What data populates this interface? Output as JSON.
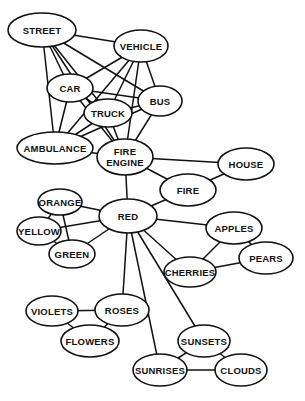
{
  "nodes": [
    {
      "id": "street",
      "label": [
        "STREET"
      ],
      "cx": 42,
      "cy": 30,
      "rx": 34,
      "ry": 17
    },
    {
      "id": "vehicle",
      "label": [
        "VEHICLE"
      ],
      "cx": 141,
      "cy": 46,
      "rx": 27,
      "ry": 16
    },
    {
      "id": "car",
      "label": [
        "CAR"
      ],
      "cx": 70,
      "cy": 88,
      "rx": 23,
      "ry": 14
    },
    {
      "id": "bus",
      "label": [
        "BUS"
      ],
      "cx": 160,
      "cy": 101,
      "rx": 22,
      "ry": 15
    },
    {
      "id": "truck",
      "label": [
        "TRUCK"
      ],
      "cx": 108,
      "cy": 113,
      "rx": 24,
      "ry": 14
    },
    {
      "id": "ambulance",
      "label": [
        "AMBULANCE"
      ],
      "cx": 55,
      "cy": 148,
      "rx": 38,
      "ry": 16
    },
    {
      "id": "fire-engine",
      "label": [
        "FIRE",
        "ENGINE"
      ],
      "cx": 125,
      "cy": 157,
      "rx": 28,
      "ry": 18
    },
    {
      "id": "house",
      "label": [
        "HOUSE"
      ],
      "cx": 246,
      "cy": 164,
      "rx": 28,
      "ry": 16
    },
    {
      "id": "fire",
      "label": [
        "FIRE"
      ],
      "cx": 188,
      "cy": 190,
      "rx": 28,
      "ry": 16
    },
    {
      "id": "orange",
      "label": [
        "ORANGE"
      ],
      "cx": 60,
      "cy": 202,
      "rx": 22,
      "ry": 13
    },
    {
      "id": "red",
      "label": [
        "RED"
      ],
      "cx": 128,
      "cy": 216,
      "rx": 29,
      "ry": 17
    },
    {
      "id": "yellow",
      "label": [
        "YELLOW"
      ],
      "cx": 39,
      "cy": 231,
      "rx": 22,
      "ry": 14
    },
    {
      "id": "apples",
      "label": [
        "APPLES"
      ],
      "cx": 234,
      "cy": 228,
      "rx": 28,
      "ry": 16
    },
    {
      "id": "green",
      "label": [
        "GREEN"
      ],
      "cx": 72,
      "cy": 254,
      "rx": 23,
      "ry": 14
    },
    {
      "id": "pears",
      "label": [
        "PEARS"
      ],
      "cx": 266,
      "cy": 258,
      "rx": 27,
      "ry": 16
    },
    {
      "id": "cherries",
      "label": [
        "CHERRIES"
      ],
      "cx": 190,
      "cy": 272,
      "rx": 26,
      "ry": 15
    },
    {
      "id": "violets",
      "label": [
        "VIOLETS"
      ],
      "cx": 52,
      "cy": 311,
      "rx": 26,
      "ry": 15
    },
    {
      "id": "roses",
      "label": [
        "ROSES"
      ],
      "cx": 122,
      "cy": 310,
      "rx": 27,
      "ry": 16
    },
    {
      "id": "flowers",
      "label": [
        "FLOWERS"
      ],
      "cx": 90,
      "cy": 341,
      "rx": 29,
      "ry": 16
    },
    {
      "id": "sunsets",
      "label": [
        "SUNSETS"
      ],
      "cx": 204,
      "cy": 341,
      "rx": 26,
      "ry": 16
    },
    {
      "id": "sunrises",
      "label": [
        "SUNRISES"
      ],
      "cx": 160,
      "cy": 370,
      "rx": 27,
      "ry": 16
    },
    {
      "id": "clouds",
      "label": [
        "CLOUDS"
      ],
      "cx": 241,
      "cy": 370,
      "rx": 26,
      "ry": 16
    }
  ],
  "edges": [
    [
      "street",
      "vehicle"
    ],
    [
      "street",
      "car"
    ],
    [
      "street",
      "bus"
    ],
    [
      "street",
      "truck"
    ],
    [
      "street",
      "ambulance"
    ],
    [
      "street",
      "fire-engine"
    ],
    [
      "vehicle",
      "car"
    ],
    [
      "vehicle",
      "bus"
    ],
    [
      "vehicle",
      "truck"
    ],
    [
      "vehicle",
      "ambulance"
    ],
    [
      "vehicle",
      "fire-engine"
    ],
    [
      "car",
      "bus"
    ],
    [
      "car",
      "truck"
    ],
    [
      "car",
      "ambulance"
    ],
    [
      "car",
      "fire-engine"
    ],
    [
      "bus",
      "truck"
    ],
    [
      "bus",
      "ambulance"
    ],
    [
      "bus",
      "fire-engine"
    ],
    [
      "truck",
      "ambulance"
    ],
    [
      "truck",
      "fire-engine"
    ],
    [
      "ambulance",
      "fire-engine"
    ],
    [
      "fire-engine",
      "house"
    ],
    [
      "fire-engine",
      "fire"
    ],
    [
      "fire-engine",
      "red"
    ],
    [
      "house",
      "fire"
    ],
    [
      "fire",
      "red"
    ],
    [
      "orange",
      "red"
    ],
    [
      "orange",
      "yellow"
    ],
    [
      "orange",
      "green"
    ],
    [
      "yellow",
      "red"
    ],
    [
      "yellow",
      "green"
    ],
    [
      "green",
      "red"
    ],
    [
      "red",
      "apples"
    ],
    [
      "red",
      "cherries"
    ],
    [
      "red",
      "roses"
    ],
    [
      "red",
      "sunsets"
    ],
    [
      "red",
      "sunrises"
    ],
    [
      "apples",
      "pears"
    ],
    [
      "apples",
      "cherries"
    ],
    [
      "pears",
      "cherries"
    ],
    [
      "violets",
      "roses"
    ],
    [
      "violets",
      "flowers"
    ],
    [
      "roses",
      "flowers"
    ],
    [
      "sunsets",
      "sunrises"
    ],
    [
      "sunsets",
      "clouds"
    ],
    [
      "sunrises",
      "clouds"
    ]
  ],
  "colors": {
    "line": "#111111",
    "fill": "#ffffff",
    "background": "#ffffff"
  }
}
